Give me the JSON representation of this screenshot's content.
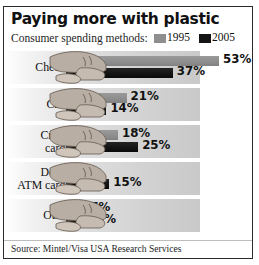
{
  "title": "Paying more with plastic",
  "legend": {
    "label": "Consumer spending methods:",
    "entries": [
      {
        "name": "1995",
        "color": "#8e8e8e"
      },
      {
        "name": "2005",
        "color": "#141414"
      }
    ]
  },
  "source": "Source: Mintel/Visa USA Research Services",
  "rows": [
    {
      "label_line1": "Checks",
      "label_line2": "",
      "v1995": "53%",
      "v2005": "37%"
    },
    {
      "label_line1": "Cash",
      "label_line2": "",
      "v1995": "21%",
      "v2005": "14%"
    },
    {
      "label_line1": "Credit",
      "label_line2": "cards",
      "v1995": "18%",
      "v2005": "25%"
    },
    {
      "label_line1": "Debit/",
      "label_line2": "ATM cards",
      "v1995": "1%",
      "v2005": "15%"
    },
    {
      "label_line1": "Other",
      "label_line2": "",
      "v1995": "7%",
      "v2005": "9%"
    }
  ],
  "chart_data": {
    "type": "bar",
    "title": "Paying more with plastic",
    "subtitle": "Consumer spending methods:",
    "orientation": "horizontal",
    "categories": [
      "Checks",
      "Cash",
      "Credit cards",
      "Debit/ATM cards",
      "Other"
    ],
    "series": [
      {
        "name": "1995",
        "color": "#8e8e8e",
        "values": [
          53,
          21,
          18,
          1,
          7
        ]
      },
      {
        "name": "2005",
        "color": "#141414",
        "values": [
          37,
          14,
          25,
          15,
          9
        ]
      }
    ],
    "unit": "percent",
    "xlabel": "",
    "ylabel": "",
    "xlim": [
      0,
      53
    ],
    "grid": false,
    "legend_position": "top-right",
    "data_labels": true,
    "annotations": [
      "Hand illustrations overlay the left end of each bar pair"
    ],
    "source": "Source: Mintel/Visa USA Research Services"
  }
}
